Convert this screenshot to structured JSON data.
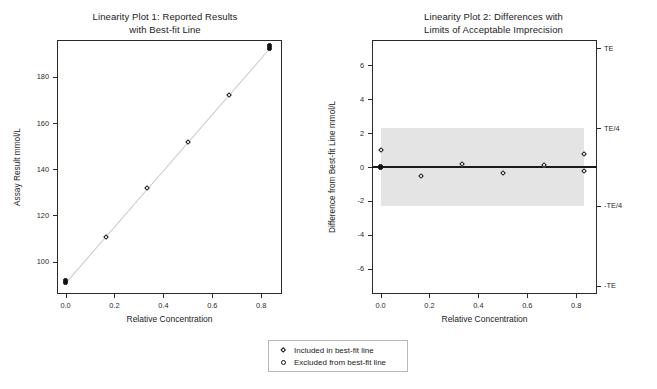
{
  "chart_data": [
    {
      "id": "plot1",
      "type": "scatter",
      "title_line1": "Linearity Plot 1:  Reported Results",
      "title_line2": "with Best-fit Line",
      "xlabel": "Relative Concentration",
      "ylabel": "Assay Result mmol/L",
      "xlim": [
        -0.035,
        0.885
      ],
      "ylim": [
        86,
        196
      ],
      "xticks": [
        0.0,
        0.2,
        0.4,
        0.6,
        0.8
      ],
      "xticklabels": [
        "0.0",
        "0.2",
        "0.4",
        "0.6",
        "0.8"
      ],
      "yticks": [
        100,
        120,
        140,
        160,
        180
      ],
      "yticklabels": [
        "100",
        "120",
        "140",
        "160",
        "180"
      ],
      "grid": false,
      "legend_position": "below-figure",
      "best_fit_line": {
        "x0": 0.0,
        "y0": 91.2,
        "x1": 0.833,
        "y1": 192.6,
        "color": "#c9c9c9"
      },
      "points": [
        {
          "x": 0.0,
          "y": 91.0,
          "marker": "solid",
          "included": true
        },
        {
          "x": 0.0,
          "y": 91.9,
          "marker": "solid",
          "included": true
        },
        {
          "x": 0.167,
          "y": 110.8,
          "marker": "diamond",
          "included": true
        },
        {
          "x": 0.333,
          "y": 131.7,
          "marker": "diamond",
          "included": true
        },
        {
          "x": 0.5,
          "y": 151.7,
          "marker": "diamond",
          "included": true
        },
        {
          "x": 0.667,
          "y": 172.0,
          "marker": "diamond",
          "included": true
        },
        {
          "x": 0.833,
          "y": 192.3,
          "marker": "solid",
          "included": true
        },
        {
          "x": 0.833,
          "y": 193.6,
          "marker": "solid",
          "included": true
        }
      ]
    },
    {
      "id": "plot2",
      "type": "scatter",
      "title_line1": "Linearity Plot 2: Differences with",
      "title_line2": "Limits of Acceptable Imprecision",
      "xlabel": "Relative Concentration",
      "ylabel": "Difference from Best-fit Line mmol/L",
      "xlim": [
        -0.035,
        0.885
      ],
      "ylim": [
        -7.5,
        7.5
      ],
      "xticks": [
        0.0,
        0.2,
        0.4,
        0.6,
        0.8
      ],
      "xticklabels": [
        "0.0",
        "0.2",
        "0.4",
        "0.6",
        "0.8"
      ],
      "yticks": [
        -6,
        -4,
        -2,
        0,
        2,
        4,
        6
      ],
      "yticklabels": [
        "-6",
        "-4",
        "-2",
        "0",
        "2",
        "4",
        "6"
      ],
      "right_axis_ticks": [
        7.0,
        2.3,
        -2.3,
        -7.0
      ],
      "right_axis_labels": [
        "TE",
        "TE/4",
        "-TE/4",
        "-TE"
      ],
      "grid": false,
      "zero_line": 0,
      "acceptance_band": {
        "upper": 2.3,
        "lower": -2.3,
        "x_start": 0.0,
        "x_end": 0.833,
        "color": "#e4e4e4"
      },
      "points": [
        {
          "x": 0.0,
          "y": 1.0,
          "marker": "diamond",
          "included": true
        },
        {
          "x": 0.0,
          "y": 0.0,
          "marker": "solid",
          "included": true
        },
        {
          "x": 0.167,
          "y": -0.52,
          "marker": "diamond",
          "included": true
        },
        {
          "x": 0.333,
          "y": 0.16,
          "marker": "diamond",
          "included": true
        },
        {
          "x": 0.5,
          "y": -0.36,
          "marker": "diamond",
          "included": true
        },
        {
          "x": 0.667,
          "y": 0.13,
          "marker": "diamond",
          "included": true
        },
        {
          "x": 0.833,
          "y": 0.75,
          "marker": "diamond",
          "included": true
        },
        {
          "x": 0.833,
          "y": -0.24,
          "marker": "diamond",
          "included": true
        }
      ]
    }
  ],
  "legend": {
    "items": [
      {
        "marker": "diamond",
        "label": "Included in best-fit line"
      },
      {
        "marker": "circle",
        "label": "Excluded from best-fit line"
      }
    ]
  },
  "colors": {
    "axis": "#2b2b2b",
    "band": "#e4e4e4",
    "fit_line": "#c9c9c9",
    "marker": "#111111",
    "text": "#1b1b1b"
  }
}
